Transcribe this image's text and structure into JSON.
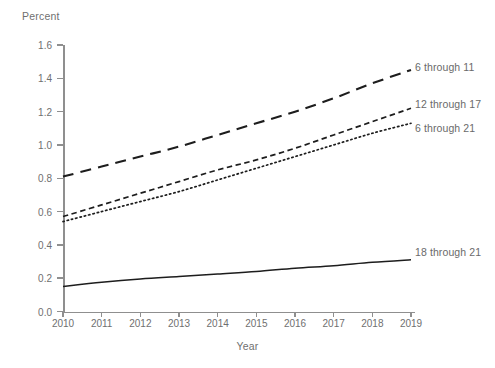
{
  "chart_data": {
    "type": "line",
    "title": "",
    "xlabel": "Year",
    "ylabel": "Percent",
    "x": [
      2010,
      2011,
      2012,
      2013,
      2014,
      2015,
      2016,
      2017,
      2018,
      2019
    ],
    "xtick_labels": [
      "2010",
      "2011",
      "2012",
      "2013",
      "2014",
      "2015",
      "2016",
      "2017",
      "2018",
      "2019"
    ],
    "ytick_labels": [
      "0.0",
      "0.2",
      "0.4",
      "0.6",
      "0.8",
      "1.0",
      "1.2",
      "1.4",
      "1.6"
    ],
    "ytick_values": [
      0.0,
      0.2,
      0.4,
      0.6,
      0.8,
      1.0,
      1.2,
      1.4,
      1.6
    ],
    "ylim": [
      0.0,
      1.6
    ],
    "xlim": [
      2010,
      2019
    ],
    "grid": false,
    "legend_position": "inline-right",
    "series": [
      {
        "name": "6 through 11",
        "style": "long-dash",
        "color": "#1d1d1d",
        "values": [
          0.81,
          0.87,
          0.93,
          0.99,
          1.06,
          1.13,
          1.2,
          1.28,
          1.37,
          1.45
        ]
      },
      {
        "name": "12 through 17",
        "style": "short-dash",
        "color": "#1d1d1d",
        "values": [
          0.57,
          0.64,
          0.71,
          0.78,
          0.85,
          0.91,
          0.98,
          1.06,
          1.14,
          1.22
        ]
      },
      {
        "name": "6 through 21",
        "style": "dotted",
        "color": "#1d1d1d",
        "values": [
          0.54,
          0.6,
          0.66,
          0.72,
          0.79,
          0.86,
          0.93,
          1.0,
          1.07,
          1.13
        ]
      },
      {
        "name": "18 through 21",
        "style": "solid",
        "color": "#1d1d1d",
        "values": [
          0.15,
          0.175,
          0.195,
          0.21,
          0.225,
          0.24,
          0.26,
          0.275,
          0.295,
          0.31
        ]
      }
    ]
  },
  "axes": {
    "y_title": "Percent",
    "x_title": "Year"
  },
  "series_labels": [
    {
      "text": "6 through 11",
      "left": 415,
      "top": 61
    },
    {
      "text": "12 through 17",
      "left": 415,
      "top": 98
    },
    {
      "text": "6 through 21",
      "left": 415,
      "top": 122
    },
    {
      "text": "18 through 21",
      "left": 415,
      "top": 246
    }
  ],
  "colors": {
    "axis": "#8f8f8f",
    "text": "#6f6f6f",
    "line": "#1d1d1d",
    "background": "#ffffff"
  }
}
